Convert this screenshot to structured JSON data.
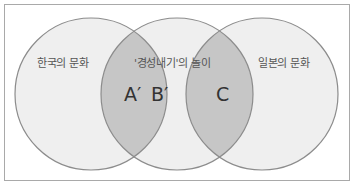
{
  "diagram": {
    "type": "venn",
    "sets": [
      {
        "id": "left",
        "label": "한국의 문화"
      },
      {
        "id": "middle",
        "label": "'경성내기'의 놀이"
      },
      {
        "id": "right",
        "label": "일본의 문화"
      }
    ],
    "regions": [
      {
        "id": "left-middle-overlap",
        "labels": [
          "A′",
          "B′"
        ]
      },
      {
        "id": "middle-right-overlap",
        "labels": [
          "C"
        ]
      }
    ],
    "colors": {
      "circle_fill": "#efefef",
      "overlap_fill": "#c6c6c6",
      "stroke": "#8c8c8c",
      "frame_border": "#a9a9a9"
    }
  }
}
